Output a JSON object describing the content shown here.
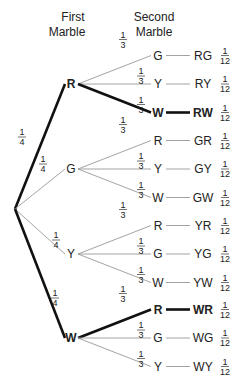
{
  "headers": {
    "first_line1": "First",
    "first_line2": "Marble",
    "second_line1": "Second",
    "second_line2": "Marble"
  },
  "first_level": [
    {
      "label": "R",
      "prob_num": "1",
      "prob_den": "4",
      "highlight": true
    },
    {
      "label": "G",
      "prob_num": "1",
      "prob_den": "4",
      "highlight": false
    },
    {
      "label": "Y",
      "prob_num": "1",
      "prob_den": "4",
      "highlight": false
    },
    {
      "label": "W",
      "prob_num": "1",
      "prob_den": "4",
      "highlight": true
    }
  ],
  "second_level": [
    {
      "label": "G",
      "outcome": "RG",
      "prob_num": "1",
      "prob_den": "3",
      "outcome_num": "1",
      "outcome_den": "12",
      "highlight": false
    },
    {
      "label": "Y",
      "outcome": "RY",
      "prob_num": "1",
      "prob_den": "3",
      "outcome_num": "1",
      "outcome_den": "12",
      "highlight": false
    },
    {
      "label": "W",
      "outcome": "RW",
      "prob_num": "1",
      "prob_den": "3",
      "outcome_num": "1",
      "outcome_den": "12",
      "highlight": true
    },
    {
      "label": "R",
      "outcome": "GR",
      "prob_num": "1",
      "prob_den": "3",
      "outcome_num": "1",
      "outcome_den": "12",
      "highlight": false
    },
    {
      "label": "Y",
      "outcome": "GY",
      "prob_num": "1",
      "prob_den": "3",
      "outcome_num": "1",
      "outcome_den": "12",
      "highlight": false
    },
    {
      "label": "W",
      "outcome": "GW",
      "prob_num": "1",
      "prob_den": "3",
      "outcome_num": "1",
      "outcome_den": "12",
      "highlight": false
    },
    {
      "label": "R",
      "outcome": "YR",
      "prob_num": "1",
      "prob_den": "3",
      "outcome_num": "1",
      "outcome_den": "12",
      "highlight": false
    },
    {
      "label": "G",
      "outcome": "YG",
      "prob_num": "1",
      "prob_den": "3",
      "outcome_num": "1",
      "outcome_den": "12",
      "highlight": false
    },
    {
      "label": "W",
      "outcome": "YW",
      "prob_num": "1",
      "prob_den": "3",
      "outcome_num": "1",
      "outcome_den": "12",
      "highlight": false
    },
    {
      "label": "R",
      "outcome": "WR",
      "prob_num": "1",
      "prob_den": "3",
      "outcome_num": "1",
      "outcome_den": "12",
      "highlight": true
    },
    {
      "label": "G",
      "outcome": "WG",
      "prob_num": "1",
      "prob_den": "3",
      "outcome_num": "1",
      "outcome_den": "12",
      "highlight": false
    },
    {
      "label": "Y",
      "outcome": "WY",
      "prob_num": "1",
      "prob_den": "3",
      "outcome_num": "1",
      "outcome_den": "12",
      "highlight": false
    }
  ],
  "colors": {
    "line": "#999999",
    "highlight": "#111111",
    "text": "#222222"
  }
}
